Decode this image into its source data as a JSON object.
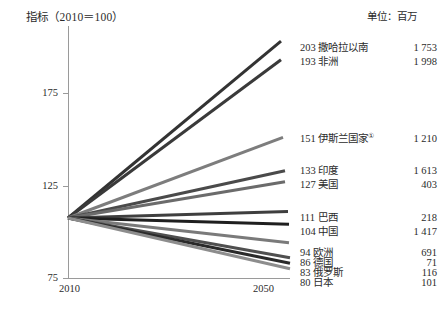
{
  "chart_data": {
    "type": "line",
    "title": "",
    "ylabel": "指标（2010＝100）",
    "xlabel": "",
    "unit_note": "单位：百万",
    "x": [
      2010,
      2050
    ],
    "x_tick_labels": [
      "2010",
      "2050"
    ],
    "y_tick_labels": [
      "175",
      "125",
      "75"
    ],
    "y_ticks": [
      175,
      125,
      75
    ],
    "ylim": [
      70,
      210
    ],
    "grid": false,
    "legend_position": "right-inline",
    "series": [
      {
        "name": "撒哈拉以南",
        "index_2050": 203,
        "value_2050": "1 753",
        "values": [
          100,
          203
        ],
        "color": "#333333"
      },
      {
        "name": "非洲",
        "index_2050": 193,
        "value_2050": "1 998",
        "values": [
          100,
          193
        ],
        "color": "#3a3a3a"
      },
      {
        "name": "伊斯兰国家",
        "footnote": "①",
        "index_2050": 151,
        "value_2050": "1 210",
        "values": [
          100,
          151
        ],
        "color": "#7d7d7d"
      },
      {
        "name": "印度",
        "index_2050": 133,
        "value_2050": "1 613",
        "values": [
          100,
          133
        ],
        "color": "#4a4a4a"
      },
      {
        "name": "美国",
        "index_2050": 127,
        "value_2050": "403",
        "values": [
          100,
          127
        ],
        "color": "#6b6b6b"
      },
      {
        "name": "巴西",
        "index_2050": 111,
        "value_2050": "218",
        "values": [
          100,
          111
        ],
        "color": "#3f3f3f"
      },
      {
        "name": "中国",
        "index_2050": 104,
        "value_2050": "1 417",
        "values": [
          100,
          104
        ],
        "color": "#1f1f1f"
      },
      {
        "name": "欧洲",
        "index_2050": 94,
        "value_2050": "691",
        "values": [
          100,
          94
        ],
        "color": "#7a7a7a"
      },
      {
        "name": "德国",
        "index_2050": 86,
        "value_2050": "71",
        "values": [
          100,
          86
        ],
        "color": "#4f4f4f"
      },
      {
        "name": "俄罗斯",
        "index_2050": 83,
        "value_2050": "116",
        "values": [
          100,
          83
        ],
        "color": "#2a2a2a"
      },
      {
        "name": "日本",
        "index_2050": 80,
        "value_2050": "101",
        "values": [
          100,
          80
        ],
        "color": "#8d8d8d"
      }
    ]
  },
  "labels": {
    "y_axis_title": "指标（2010＝100）",
    "unit_note": "单位：百万",
    "x_start": "2010",
    "x_end": "2050",
    "y_175": "175",
    "y_125": "125",
    "y_75": "75",
    "rows": [
      {
        "index": "203",
        "name": "撒哈拉以南",
        "sup": "",
        "value": "1 753"
      },
      {
        "index": "193",
        "name": "非洲",
        "sup": "",
        "value": "1 998"
      },
      {
        "index": "151",
        "name": "伊斯兰国家",
        "sup": "①",
        "value": "1 210"
      },
      {
        "index": "133",
        "name": "印度",
        "sup": "",
        "value": "1 613"
      },
      {
        "index": "127",
        "name": "美国",
        "sup": "",
        "value": "403"
      },
      {
        "index": "111",
        "name": "巴西",
        "sup": "",
        "value": "218"
      },
      {
        "index": "104",
        "name": "中国",
        "sup": "",
        "value": "1 417"
      },
      {
        "index": "94",
        "name": "欧洲",
        "sup": "",
        "value": "691"
      },
      {
        "index": "86",
        "name": "德国",
        "sup": "",
        "value": "71"
      },
      {
        "index": "83",
        "name": "俄罗斯",
        "sup": "",
        "value": "116"
      },
      {
        "index": "80",
        "name": "日本",
        "sup": "",
        "value": "101"
      }
    ]
  },
  "geometry": {
    "plot_left": 68,
    "plot_right": 290,
    "origin_y": 218,
    "label_x": 300,
    "value_right": 437,
    "row_y": [
      42,
      56,
      133,
      165,
      179,
      212,
      226,
      247,
      257,
      267,
      277
    ]
  }
}
